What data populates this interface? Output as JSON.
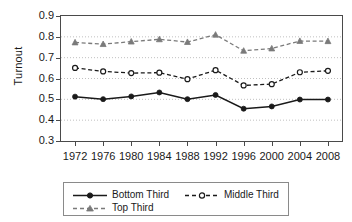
{
  "chart_data": {
    "type": "line",
    "title": "",
    "xlabel": "",
    "ylabel": "Turnout",
    "x": [
      1972,
      1976,
      1980,
      1984,
      1988,
      1992,
      1996,
      2000,
      2004,
      2008
    ],
    "categories": [
      "1972",
      "1976",
      "1980",
      "1984",
      "1988",
      "1992",
      "1996",
      "2000",
      "2004",
      "2008"
    ],
    "xlim": [
      1970,
      2010
    ],
    "ylim": [
      0.3,
      0.9
    ],
    "yticks": [
      0.3,
      0.4,
      0.5,
      0.6,
      0.7,
      0.8,
      0.9
    ],
    "ytick_labels": [
      "0.3",
      "0.4",
      "0.5",
      "0.6",
      "0.7",
      "0.8",
      "0.9"
    ],
    "grid": true,
    "grid_style": "dotted-horizontal",
    "legend_position": "below",
    "series": [
      {
        "name": "Bottom Third",
        "values": [
          0.513,
          0.501,
          0.514,
          0.533,
          0.501,
          0.521,
          0.455,
          0.466,
          0.499,
          0.499
        ],
        "line_style": "solid",
        "marker": "filled-circle",
        "color": "#1a1a1a"
      },
      {
        "name": "Middle Third",
        "values": [
          0.651,
          0.634,
          0.626,
          0.628,
          0.597,
          0.64,
          0.567,
          0.573,
          0.63,
          0.637
        ],
        "line_style": "dashed",
        "marker": "open-circle",
        "color": "#1a1a1a"
      },
      {
        "name": "Top Third",
        "values": [
          0.773,
          0.765,
          0.777,
          0.788,
          0.775,
          0.81,
          0.733,
          0.744,
          0.78,
          0.779
        ],
        "line_style": "dashed",
        "marker": "filled-triangle",
        "color": "#7a7a7a"
      }
    ]
  },
  "legend": {
    "items": [
      {
        "label": "Bottom Third"
      },
      {
        "label": "Middle Third"
      },
      {
        "label": "Top Third"
      }
    ]
  },
  "axes": {
    "y_title": "Turnout"
  }
}
